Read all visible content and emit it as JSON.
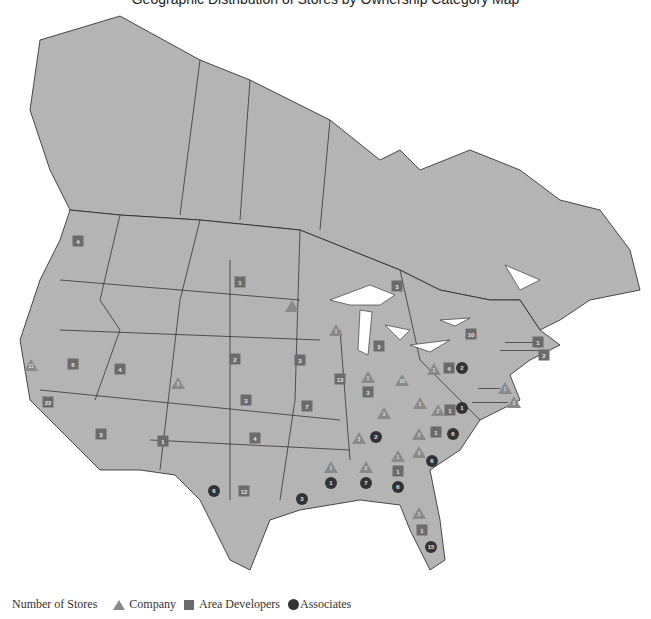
{
  "title": "Geographic Distribution of Stores by Ownership Category Map",
  "legend": {
    "label": "Number of Stores",
    "items": [
      {
        "shape": "triangle",
        "label": "Company",
        "color": "#8a8a8a"
      },
      {
        "shape": "square",
        "label": "Area Developers",
        "color": "#6b6b6b"
      },
      {
        "shape": "circle",
        "label": "Associates",
        "color": "#333333"
      }
    ]
  },
  "colors": {
    "land": "#b4b4b4",
    "border": "#222222",
    "water": "#ffffff"
  },
  "markers": [
    {
      "region": "Washington",
      "type": "square",
      "value": "4",
      "x": 78,
      "y": 241
    },
    {
      "region": "California",
      "type": "triangle",
      "value": "11",
      "x": 31,
      "y": 365
    },
    {
      "region": "California",
      "type": "square",
      "value": "22",
      "x": 48,
      "y": 402
    },
    {
      "region": "Nevada",
      "type": "square",
      "value": "6",
      "x": 73,
      "y": 364
    },
    {
      "region": "Utah",
      "type": "square",
      "value": "4",
      "x": 120,
      "y": 369
    },
    {
      "region": "Colorado",
      "type": "triangle",
      "value": "3",
      "x": 178,
      "y": 383
    },
    {
      "region": "Arizona",
      "type": "square",
      "value": "3",
      "x": 101,
      "y": 434
    },
    {
      "region": "New Mexico",
      "type": "square",
      "value": "1",
      "x": 163,
      "y": 441
    },
    {
      "region": "North Dakota",
      "type": "square",
      "value": "1",
      "x": 240,
      "y": 282
    },
    {
      "region": "Minnesota",
      "type": "triangle",
      "value": "",
      "x": 292,
      "y": 306
    },
    {
      "region": "Wisconsin",
      "type": "triangle",
      "value": "1",
      "x": 336,
      "y": 330
    },
    {
      "region": "Ontario",
      "type": "square",
      "value": "3",
      "x": 397,
      "y": 286
    },
    {
      "region": "Michigan",
      "type": "square",
      "value": "3",
      "x": 379,
      "y": 346
    },
    {
      "region": "Nebraska",
      "type": "square",
      "value": "2",
      "x": 235,
      "y": 359
    },
    {
      "region": "Iowa",
      "type": "square",
      "value": "3",
      "x": 300,
      "y": 360
    },
    {
      "region": "Kansas",
      "type": "square",
      "value": "3",
      "x": 246,
      "y": 400
    },
    {
      "region": "Missouri",
      "type": "square",
      "value": "7",
      "x": 307,
      "y": 406
    },
    {
      "region": "Oklahoma",
      "type": "square",
      "value": "4",
      "x": 255,
      "y": 438
    },
    {
      "region": "Illinois",
      "type": "square",
      "value": "13",
      "x": 340,
      "y": 379
    },
    {
      "region": "Indiana",
      "type": "triangle",
      "value": "1",
      "x": 368,
      "y": 377
    },
    {
      "region": "Indiana",
      "type": "square",
      "value": "3",
      "x": 368,
      "y": 392
    },
    {
      "region": "Ohio",
      "type": "triangle",
      "value": "10",
      "x": 402,
      "y": 380
    },
    {
      "region": "Kentucky",
      "type": "triangle",
      "value": "3",
      "x": 384,
      "y": 413
    },
    {
      "region": "West Virginia",
      "type": "triangle",
      "value": "1",
      "x": 420,
      "y": 403
    },
    {
      "region": "Pennsylvania",
      "type": "triangle",
      "value": "1",
      "x": 434,
      "y": 369
    },
    {
      "region": "Pennsylvania",
      "type": "square",
      "value": "4",
      "x": 449,
      "y": 368
    },
    {
      "region": "Pennsylvania",
      "type": "circle",
      "value": "2",
      "x": 462,
      "y": 368
    },
    {
      "region": "New York",
      "type": "square",
      "value": "10",
      "x": 471,
      "y": 334
    },
    {
      "region": "Massachusetts",
      "type": "square",
      "value": "1",
      "x": 538,
      "y": 342
    },
    {
      "region": "Connecticut",
      "type": "square",
      "value": "2",
      "x": 544,
      "y": 355
    },
    {
      "region": "Delaware",
      "type": "triangle",
      "value": "1",
      "x": 505,
      "y": 388
    },
    {
      "region": "Maryland",
      "type": "triangle",
      "value": "3",
      "x": 514,
      "y": 402
    },
    {
      "region": "Virginia",
      "type": "triangle",
      "value": "2",
      "x": 438,
      "y": 410
    },
    {
      "region": "Virginia",
      "type": "square",
      "value": "1",
      "x": 450,
      "y": 410
    },
    {
      "region": "Virginia",
      "type": "circle",
      "value": "1",
      "x": 462,
      "y": 408
    },
    {
      "region": "Tennessee",
      "type": "triangle",
      "value": "3",
      "x": 359,
      "y": 438
    },
    {
      "region": "Tennessee",
      "type": "circle",
      "value": "2",
      "x": 376,
      "y": 437
    },
    {
      "region": "North Carolina",
      "type": "triangle",
      "value": "2",
      "x": 419,
      "y": 434
    },
    {
      "region": "North Carolina",
      "type": "square",
      "value": "1",
      "x": 436,
      "y": 432
    },
    {
      "region": "North Carolina",
      "type": "circle",
      "value": "6",
      "x": 453,
      "y": 434
    },
    {
      "region": "South Carolina",
      "type": "triangle",
      "value": "3",
      "x": 419,
      "y": 452
    },
    {
      "region": "South Carolina",
      "type": "circle",
      "value": "6",
      "x": 432,
      "y": 461
    },
    {
      "region": "Mississippi",
      "type": "triangle",
      "value": "1",
      "x": 331,
      "y": 467
    },
    {
      "region": "Mississippi",
      "type": "circle",
      "value": "1",
      "x": 331,
      "y": 483
    },
    {
      "region": "Alabama",
      "type": "triangle",
      "value": "2",
      "x": 366,
      "y": 467
    },
    {
      "region": "Alabama",
      "type": "circle",
      "value": "7",
      "x": 366,
      "y": 483
    },
    {
      "region": "Georgia",
      "type": "triangle",
      "value": "1",
      "x": 398,
      "y": 456
    },
    {
      "region": "Georgia",
      "type": "square",
      "value": "1",
      "x": 398,
      "y": 471
    },
    {
      "region": "Georgia",
      "type": "circle",
      "value": "6",
      "x": 398,
      "y": 487
    },
    {
      "region": "Louisiana",
      "type": "circle",
      "value": "3",
      "x": 302,
      "y": 499
    },
    {
      "region": "Texas",
      "type": "circle",
      "value": "6",
      "x": 214,
      "y": 491
    },
    {
      "region": "Texas",
      "type": "square",
      "value": "12",
      "x": 244,
      "y": 491
    },
    {
      "region": "Florida",
      "type": "triangle",
      "value": "1",
      "x": 419,
      "y": 513
    },
    {
      "region": "Florida",
      "type": "square",
      "value": "1",
      "x": 422,
      "y": 530
    },
    {
      "region": "Florida",
      "type": "circle",
      "value": "15",
      "x": 431,
      "y": 547
    }
  ]
}
